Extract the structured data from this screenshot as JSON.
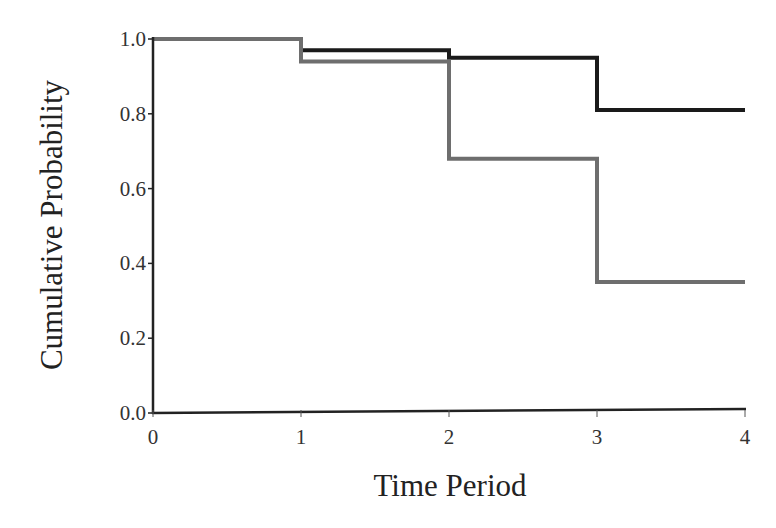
{
  "chart_data": {
    "type": "line",
    "step": true,
    "title": "",
    "xlabel": "Time Period",
    "ylabel": "Cumulative Probability",
    "xlim": [
      0,
      4
    ],
    "ylim": [
      0.0,
      1.0
    ],
    "x_ticks": [
      "0",
      "1",
      "2",
      "3",
      "4"
    ],
    "y_ticks": [
      "0.0",
      "0.2",
      "0.4",
      "0.6",
      "0.8",
      "1.0"
    ],
    "grid": false,
    "legend": null,
    "series": [
      {
        "name": "Group 1 (black)",
        "color": "#1a1a1a",
        "x": [
          0,
          1,
          2,
          3,
          4
        ],
        "values": [
          1.0,
          0.97,
          0.95,
          0.81,
          0.81
        ]
      },
      {
        "name": "Group 2 (gray)",
        "color": "#6e6e6e",
        "x": [
          0,
          1,
          2,
          3,
          4
        ],
        "values": [
          1.0,
          0.94,
          0.68,
          0.35,
          0.35
        ]
      }
    ]
  },
  "axes": {
    "x_title": "Time Period",
    "y_title": "Cumulative Probability"
  }
}
